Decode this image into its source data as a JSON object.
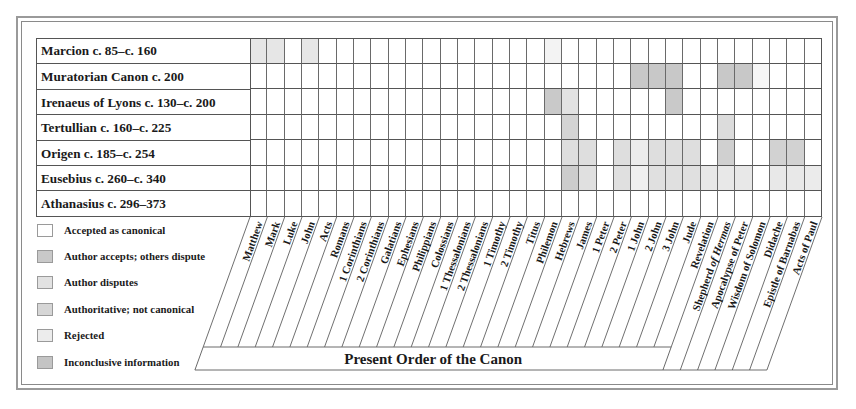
{
  "chart_data": {
    "type": "table",
    "title": "",
    "footer_label": "Present Order of the Canon",
    "rows": [
      "Marcion c. 85–c. 160",
      "Muratorian Canon c. 200",
      "Irenaeus of Lyons c. 130–c. 200",
      "Tertullian c. 160–c. 225",
      "Origen c. 185–c. 254",
      "Eusebius c. 260–c. 340",
      "Athanasius c. 296–373"
    ],
    "columns": [
      "Matthew",
      "Mark",
      "Luke",
      "John",
      "Acts",
      "Romans",
      "1 Corinthians",
      "2 Corinthians",
      "Galatians",
      "Ephesians",
      "Philippians",
      "Colossians",
      "1 Thessalonians",
      "2 Thessalonians",
      "1 Timothy",
      "2 Timothy",
      "Titus",
      "Philemon",
      "Hebrews",
      "James",
      "1 Peter",
      "2 Peter",
      "1 John",
      "2 John",
      "3 John",
      "Jude",
      "Revelation",
      "Shepherd of Hermas",
      "Apocalypse of Peter",
      "Wisdom of Solomon",
      "Didache",
      "Epistle of Barnabas",
      "Acts of Paul"
    ],
    "present_canon_count": 27,
    "legend": [
      {
        "key": "A",
        "label": "Accepted as canonical",
        "color": "#ffffff"
      },
      {
        "key": "P",
        "label": "Author accepts; others dispute",
        "color": "#c9c9c9"
      },
      {
        "key": "D",
        "label": "Author disputes",
        "color": "#e2e2e2"
      },
      {
        "key": "N",
        "label": "Authoritative; not canonical",
        "color": "#d6d6d6"
      },
      {
        "key": "R",
        "label": "Rejected",
        "color": "#ececec"
      },
      {
        "key": "I",
        "label": "Inconclusive information",
        "color": "#c4c4c4"
      }
    ],
    "cells": [
      "RRARAAAAAAAAAAAAAR...............",
      "AAAAAAAAAAAAAAAAAA....III....II....",
      "AAAAAAAAAAAAAAAAAIDD....I.........",
      "AAAAAAAAAAAAAAAAAADDA.......D.....",
      "AAAAAAAAAAAAAAAAAADD.D.DDDD.N..NN.",
      "AAAAAAAAAAAAAAAAAAPD.D.DDDDDDD.DDDD",
      "AAAAAAAAAAAAAAAAAAAAAAAAAAA......"
    ]
  },
  "grid_shading": [
    [
      "#e6e6e6",
      "#e6e6e6",
      "#ffffff",
      "#e6e6e6",
      "#ffffff",
      "#ffffff",
      "#ffffff",
      "#ffffff",
      "#ffffff",
      "#ffffff",
      "#ffffff",
      "#ffffff",
      "#ffffff",
      "#ffffff",
      "#ffffff",
      "#ffffff",
      "#ffffff",
      "#f3f3f3",
      "#ffffff",
      "#ffffff",
      "#ffffff",
      "#ffffff",
      "#ffffff",
      "#ffffff",
      "#ffffff",
      "#ffffff",
      "#ffffff",
      "#ffffff",
      "#ffffff",
      "#ffffff",
      "#ffffff",
      "#ffffff",
      "#ffffff"
    ],
    [
      "#ffffff",
      "#ffffff",
      "#ffffff",
      "#ffffff",
      "#ffffff",
      "#ffffff",
      "#ffffff",
      "#ffffff",
      "#ffffff",
      "#ffffff",
      "#ffffff",
      "#ffffff",
      "#ffffff",
      "#ffffff",
      "#ffffff",
      "#ffffff",
      "#ffffff",
      "#ffffff",
      "#ffffff",
      "#ffffff",
      "#ffffff",
      "#ffffff",
      "#c8c8c8",
      "#c8c8c8",
      "#c8c8c8",
      "#ffffff",
      "#ffffff",
      "#c8c8c8",
      "#c8c8c8",
      "#f6f6f6",
      "#ffffff",
      "#ffffff",
      "#ffffff"
    ],
    [
      "#ffffff",
      "#ffffff",
      "#ffffff",
      "#ffffff",
      "#ffffff",
      "#ffffff",
      "#ffffff",
      "#ffffff",
      "#ffffff",
      "#ffffff",
      "#ffffff",
      "#ffffff",
      "#ffffff",
      "#ffffff",
      "#ffffff",
      "#ffffff",
      "#ffffff",
      "#c9c9c9",
      "#e2e2e2",
      "#ffffff",
      "#ffffff",
      "#ffffff",
      "#ffffff",
      "#ffffff",
      "#c9c9c9",
      "#ffffff",
      "#ffffff",
      "#ffffff",
      "#ffffff",
      "#ffffff",
      "#ffffff",
      "#ffffff",
      "#ffffff"
    ],
    [
      "#ffffff",
      "#ffffff",
      "#ffffff",
      "#ffffff",
      "#ffffff",
      "#ffffff",
      "#ffffff",
      "#ffffff",
      "#ffffff",
      "#ffffff",
      "#ffffff",
      "#ffffff",
      "#ffffff",
      "#ffffff",
      "#ffffff",
      "#ffffff",
      "#ffffff",
      "#ffffff",
      "#d4d4d4",
      "#ffffff",
      "#ffffff",
      "#ffffff",
      "#ffffff",
      "#ffffff",
      "#ffffff",
      "#ffffff",
      "#ffffff",
      "#dcdcdc",
      "#ffffff",
      "#ffffff",
      "#ffffff",
      "#ffffff",
      "#ffffff"
    ],
    [
      "#ffffff",
      "#ffffff",
      "#ffffff",
      "#ffffff",
      "#ffffff",
      "#ffffff",
      "#ffffff",
      "#ffffff",
      "#ffffff",
      "#ffffff",
      "#ffffff",
      "#ffffff",
      "#ffffff",
      "#ffffff",
      "#ffffff",
      "#ffffff",
      "#ffffff",
      "#ffffff",
      "#dedede",
      "#dedede",
      "#ffffff",
      "#dedede",
      "#ececec",
      "#dedede",
      "#dedede",
      "#dedede",
      "#ffffff",
      "#d0d0d0",
      "#ffffff",
      "#ffffff",
      "#d2d2d2",
      "#d2d2d2",
      "#ffffff"
    ],
    [
      "#ffffff",
      "#ffffff",
      "#ffffff",
      "#ffffff",
      "#ffffff",
      "#ffffff",
      "#ffffff",
      "#ffffff",
      "#ffffff",
      "#ffffff",
      "#ffffff",
      "#ffffff",
      "#ffffff",
      "#ffffff",
      "#ffffff",
      "#ffffff",
      "#ffffff",
      "#ffffff",
      "#cdcdcd",
      "#e0e0e0",
      "#ffffff",
      "#e0e0e0",
      "#f0f0f0",
      "#e0e0e0",
      "#e0e0e0",
      "#e0e0e0",
      "#e8e8e8",
      "#e8e8e8",
      "#e8e8e8",
      "#ffffff",
      "#e8e8e8",
      "#e8e8e8",
      "#ebebeb"
    ],
    [
      "#ffffff",
      "#ffffff",
      "#ffffff",
      "#ffffff",
      "#ffffff",
      "#ffffff",
      "#ffffff",
      "#ffffff",
      "#ffffff",
      "#ffffff",
      "#ffffff",
      "#ffffff",
      "#ffffff",
      "#ffffff",
      "#ffffff",
      "#ffffff",
      "#ffffff",
      "#ffffff",
      "#ffffff",
      "#ffffff",
      "#ffffff",
      "#ffffff",
      "#ffffff",
      "#ffffff",
      "#ffffff",
      "#ffffff",
      "#ffffff",
      "#ffffff",
      "#ffffff",
      "#ffffff",
      "#ffffff",
      "#ffffff",
      "#ffffff"
    ]
  ],
  "legend_swatches": [
    "#ffffff",
    "#c9c9c9",
    "#e2e2e2",
    "#d6d6d6",
    "#ececec",
    "#c4c4c4"
  ]
}
